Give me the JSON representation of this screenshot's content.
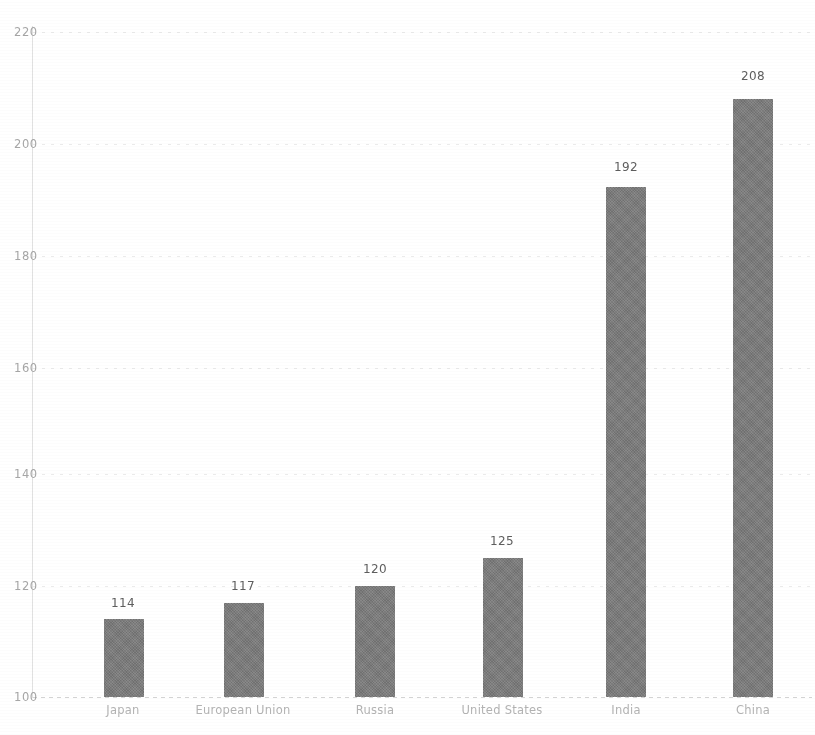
{
  "chart_data": {
    "type": "bar",
    "title": "",
    "subtitle": "",
    "xlabel": "",
    "ylabel": "",
    "categories": [
      "Japan",
      "European Union",
      "Russia",
      "United States",
      "India",
      "China"
    ],
    "values": [
      114,
      117,
      120,
      125,
      192,
      208
    ],
    "value_labels": [
      "114",
      "117",
      "120",
      "125",
      "192",
      "208"
    ],
    "ylim": [
      100,
      220
    ],
    "yticks": [
      100,
      120,
      140,
      160,
      180,
      200,
      220
    ],
    "ytick_labels": [
      "100",
      "120",
      "140",
      "160",
      "180",
      "200",
      "220"
    ],
    "grid": true,
    "grid_axis": "y",
    "legend": false,
    "legend_position": "none",
    "series": [
      {
        "name": "",
        "values": [
          114,
          117,
          120,
          125,
          192,
          208
        ]
      }
    ],
    "colors": {
      "bar": "#7b7b7b",
      "value_label": "#5e5e5e",
      "tick_label": "#a6a6a6",
      "category_label": "#b3b3b3",
      "gridline": "#cfcfcf",
      "background": "#ffffff"
    }
  }
}
